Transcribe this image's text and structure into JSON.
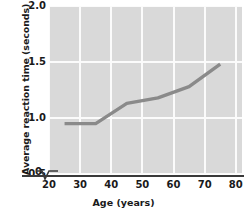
{
  "chart_data": {
    "type": "line",
    "title": "",
    "xlabel": "Age (years)",
    "ylabel": "Average reaction time (seconds)",
    "xlim": [
      20,
      82
    ],
    "ylim": [
      0.5,
      2.0
    ],
    "xticks": [
      "20",
      "30",
      "40",
      "50",
      "60",
      "70",
      "80"
    ],
    "xtick_values": [
      20,
      30,
      40,
      50,
      60,
      70,
      80
    ],
    "yticks": [
      "0",
      "0.5",
      "1.0",
      "1.5",
      "2.0"
    ],
    "ytick_values": [
      0,
      0.5,
      1.0,
      1.5,
      2.0
    ],
    "grid": true,
    "legend": "none",
    "axis_break": true,
    "series": [
      {
        "name": "Average reaction time",
        "color": "#8a8a8a",
        "x": [
          25,
          35,
          45,
          55,
          65,
          75
        ],
        "values": [
          0.95,
          0.95,
          1.13,
          1.18,
          1.28,
          1.48
        ]
      }
    ],
    "colors": {
      "plot_background": "#d9d9d9",
      "gridline": "#fbfbfb",
      "axis": "#3a3a3a",
      "line": "#8a8a8a",
      "text": "#1a1a1a"
    }
  }
}
